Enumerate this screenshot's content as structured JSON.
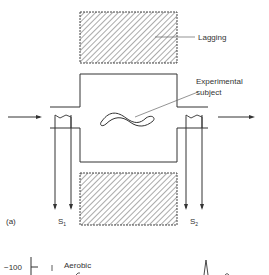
{
  "figure": {
    "panel_label": "(a)",
    "labels": {
      "lagging": "Lagging",
      "experimental_subject_line1": "Experimental",
      "experimental_subject_line2": "subject",
      "sensor_left": "S",
      "sensor_left_sub": "1",
      "sensor_right": "S",
      "sensor_right_sub": "2"
    },
    "lower_panel": {
      "y_tick": "−100",
      "series_label": "Aerobic"
    },
    "colors": {
      "line": "#333333",
      "hatch": "#555555",
      "background": "#ffffff"
    }
  }
}
